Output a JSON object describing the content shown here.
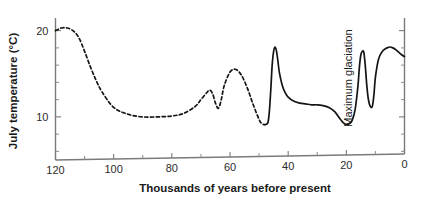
{
  "chart_data": {
    "type": "line",
    "title": "",
    "xlabel": "Thousands of years before present",
    "ylabel": "July temperature (°C)",
    "xlim": [
      120,
      0
    ],
    "ylim": [
      5,
      21
    ],
    "x_reversed": true,
    "grid": false,
    "legend": "none",
    "xticks": [
      120,
      100,
      80,
      60,
      40,
      20,
      0
    ],
    "xtick_labels": [
      "120",
      "100",
      "80",
      "60",
      "40",
      "20",
      "0"
    ],
    "xticks_minor": [
      110,
      90,
      70,
      50,
      30,
      10
    ],
    "yticks": [
      10,
      20
    ],
    "ytick_labels": [
      "10",
      "20"
    ],
    "yticks_minor": [
      6,
      8,
      12,
      14,
      16,
      18
    ],
    "annotations": [
      {
        "text": "Maximum glaciation",
        "x": 18,
        "y": 14.5,
        "rotation": -90
      }
    ],
    "series": [
      {
        "name": "July temperature (reconstructed, dashed)",
        "style": "dashed",
        "x": [
          120,
          118,
          116,
          114,
          112,
          110,
          108,
          106,
          104,
          100,
          95,
          90,
          85,
          80,
          76,
          72,
          70,
          68,
          67,
          66,
          65,
          64,
          63,
          62,
          60,
          58,
          56,
          54,
          52,
          50,
          49,
          48
        ],
        "y": [
          20.0,
          20.3,
          20.3,
          20.0,
          19.2,
          17.6,
          15.8,
          14.2,
          12.9,
          11.1,
          10.3,
          10.0,
          10.0,
          10.1,
          10.4,
          11.2,
          12.0,
          12.8,
          13.1,
          12.7,
          11.6,
          11.0,
          12.0,
          13.6,
          15.2,
          15.5,
          14.8,
          13.3,
          11.4,
          9.7,
          9.2,
          9.1
        ]
      },
      {
        "name": "July temperature (measured, solid)",
        "style": "solid",
        "x": [
          48,
          47,
          46.5,
          46,
          45.5,
          45,
          44.5,
          44,
          43.5,
          43,
          42,
          41,
          40,
          38,
          36,
          34,
          32,
          30,
          28,
          26,
          24,
          22,
          21,
          20,
          19,
          18,
          17,
          16,
          15.5,
          15,
          14.5,
          14,
          13.5,
          13,
          12.5,
          12,
          11.5,
          11,
          10.5,
          10,
          9,
          8,
          7,
          6,
          5,
          4,
          3,
          2,
          1,
          0
        ],
        "y": [
          9.1,
          9.3,
          10.5,
          13.0,
          16.0,
          17.6,
          18.1,
          17.6,
          16.4,
          15.1,
          13.6,
          12.8,
          12.3,
          11.8,
          11.6,
          11.5,
          11.4,
          11.4,
          11.3,
          11.1,
          10.6,
          9.7,
          9.3,
          9.1,
          9.2,
          9.6,
          10.8,
          13.6,
          15.8,
          17.2,
          17.6,
          17.5,
          16.0,
          13.8,
          12.2,
          11.4,
          11.1,
          11.3,
          12.6,
          14.6,
          16.6,
          17.4,
          17.8,
          18.0,
          18.1,
          18.0,
          17.8,
          17.5,
          17.2,
          17.0
        ]
      }
    ]
  },
  "figure": {
    "background_color": "#ffffff",
    "curve_color": "#141414",
    "axis_color": "#7a7a7a",
    "text_color": "#1a1a1a"
  }
}
